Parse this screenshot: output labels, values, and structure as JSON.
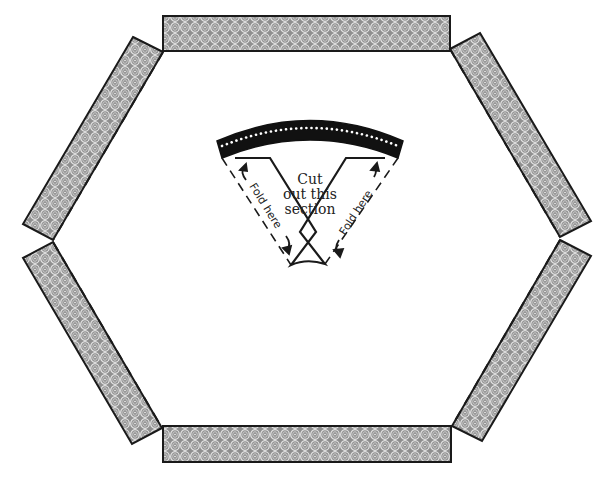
{
  "diagram": {
    "type": "craft-template",
    "shape": "hexagon-frame",
    "colors": {
      "strip_fill": "#9a9a9a",
      "strip_pattern_ring": "#e8e8e8",
      "outline": "#1a1a1a",
      "band": "#111111",
      "background": "#ffffff"
    },
    "center_piece": {
      "instruction_lines": [
        "Cut",
        "out this",
        "section"
      ],
      "fold_left": "Fold here",
      "fold_right": "Fold here"
    },
    "strips": [
      {
        "name": "top"
      },
      {
        "name": "top-right"
      },
      {
        "name": "bottom-right"
      },
      {
        "name": "bottom"
      },
      {
        "name": "bottom-left"
      },
      {
        "name": "top-left"
      }
    ]
  }
}
